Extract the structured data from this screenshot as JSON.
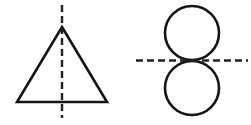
{
  "page": {
    "background_color": "#ffffff",
    "width": 251,
    "height": 125
  },
  "style": {
    "shape_stroke_color": "#151515",
    "shape_stroke_width": 2.6,
    "axis_stroke_color": "#222222",
    "axis_stroke_width": 2.4,
    "axis_dash_pattern": "7 4"
  },
  "figures": [
    {
      "id": "triangle-figure",
      "name": "triangle-with-vertical-axis",
      "shape": "triangle",
      "shape_label": "Equilateral triangle",
      "axis_label": "Vertical dashed axis of symmetry",
      "axis_orientation": "vertical",
      "geometry": {
        "apex": [
          62,
          27
        ],
        "base_left": [
          17,
          102
        ],
        "base_right": [
          107,
          102
        ],
        "axis_x": 62,
        "axis_y_start": 5,
        "axis_y_end": 118
      }
    },
    {
      "id": "double-circle-figure",
      "name": "two-tangent-circles-with-horizontal-axis",
      "shape": "two-tangent-circles",
      "shape_label": "Two equal circles touching at a point",
      "axis_label": "Horizontal dashed axis of symmetry",
      "axis_orientation": "horizontal",
      "geometry": {
        "upper_circle_center": [
          192,
          33
        ],
        "upper_circle_radius": 27,
        "lower_circle_center": [
          192,
          88
        ],
        "lower_circle_radius": 27,
        "tangent_point": [
          192,
          60.5
        ],
        "axis_y": 60.5,
        "axis_x_start": 136,
        "axis_x_end": 248
      }
    }
  ]
}
